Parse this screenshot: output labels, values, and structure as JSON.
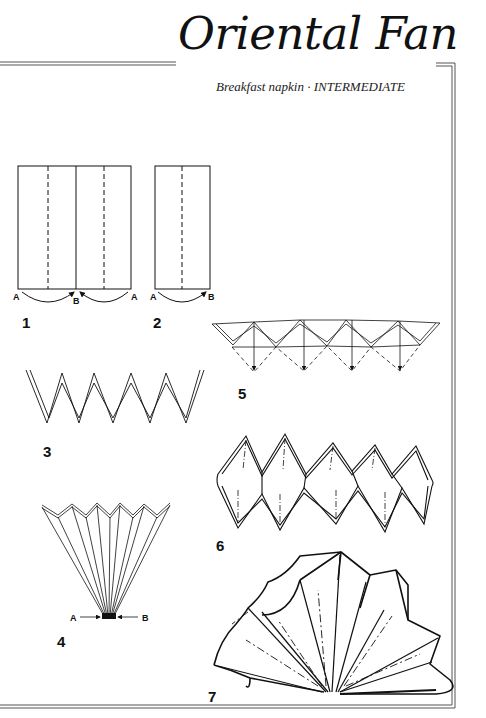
{
  "page": {
    "title": "Oriental Fan",
    "subtitle": "Breakfast napkin · INTERMEDIATE",
    "napkin_type": "Breakfast napkin",
    "difficulty": "INTERMEDIATE"
  },
  "steps": [
    {
      "number": "1",
      "description": "Fold outer edges A to centre B",
      "labels": [
        "A",
        "B",
        "A"
      ]
    },
    {
      "number": "2",
      "description": "Fold edge A to B",
      "labels": [
        "A",
        "B"
      ]
    },
    {
      "number": "3",
      "description": "Pleated zig-zag (side view)"
    },
    {
      "number": "4",
      "description": "Gather base A and B together into fan",
      "labels": [
        "A",
        "B"
      ]
    },
    {
      "number": "5",
      "description": "Push down pleat tips along dashed lines"
    },
    {
      "number": "6",
      "description": "Reverse folded pleats"
    },
    {
      "number": "7",
      "description": "Finished oriental fan"
    }
  ],
  "colors": {
    "ink": "#111111",
    "paper": "#ffffff",
    "rule": "#555555"
  }
}
